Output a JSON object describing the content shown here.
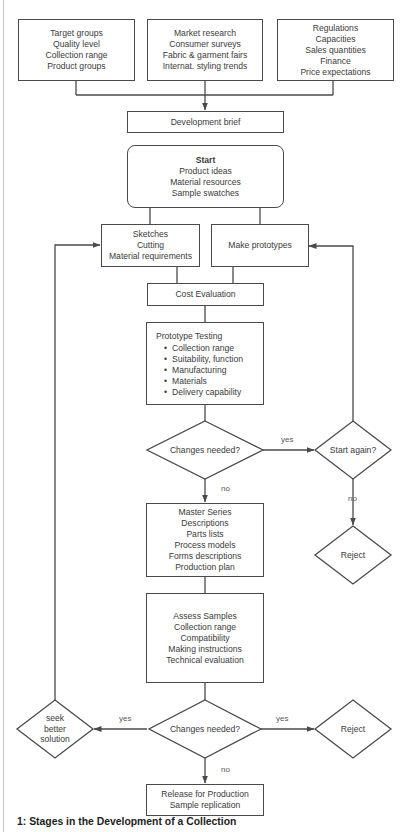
{
  "diagram": {
    "inputs": [
      {
        "lines": [
          "Target groups",
          "Quality level",
          "Collection range",
          "Product groups"
        ]
      },
      {
        "lines": [
          "Market research",
          "Consumer surveys",
          "Fabric & garment fairs",
          "Internat. styling trends"
        ]
      },
      {
        "lines": [
          "Regulations",
          "Capacities",
          "Sales quantities",
          "Finance",
          "Price expectations"
        ]
      }
    ],
    "development_brief": "Development brief",
    "start": {
      "title": "Start",
      "lines": [
        "Product ideas",
        "Material resources",
        "Sample swatches"
      ]
    },
    "sketches": {
      "lines": [
        "Sketches",
        "Cutting",
        "Material requirements"
      ]
    },
    "make_prototypes": "Make prototypes",
    "cost_evaluation": "Cost Evaluation",
    "prototype_testing": {
      "title": "Prototype Testing",
      "bullets": [
        "Collection range",
        "Suitability, function",
        "Manufacturing",
        "Materials",
        "Delivery capability"
      ]
    },
    "decision1": "Changes needed?",
    "start_again": "Start again?",
    "reject1": "Reject",
    "master_series": {
      "lines": [
        "Master Series",
        "Descriptions",
        "Parts lists",
        "Process models",
        "Forms descriptions",
        "Production plan"
      ]
    },
    "assess_samples": {
      "lines": [
        "Assess Samples",
        "Collection range",
        "Compatibility",
        "Making instructions",
        "Technical evaluation"
      ]
    },
    "decision2": "Changes needed?",
    "seek_better": {
      "lines": [
        "seek",
        "better",
        "solution"
      ]
    },
    "reject2": "Reject",
    "release": {
      "lines": [
        "Release for Production",
        "Sample replication"
      ]
    },
    "edge_labels": {
      "d1_yes": "yes",
      "d1_no": "no",
      "start_again_no": "no",
      "d2_yes_left": "yes",
      "d2_yes_right": "yes",
      "d2_no": "no"
    },
    "line_color": "#4a4a4a"
  },
  "caption": "1:  Stages in the Development of a Collection"
}
